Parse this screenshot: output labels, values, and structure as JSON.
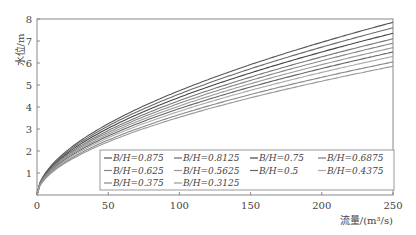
{
  "chart_data": {
    "type": "line",
    "title": "",
    "xlabel": "流量/(m³/s)",
    "ylabel": "水位/m",
    "xlim": [
      0,
      250
    ],
    "ylim": [
      0,
      8
    ],
    "xticks": [
      0,
      50,
      100,
      150,
      200,
      250
    ],
    "yticks": [
      1,
      2,
      3,
      4,
      5,
      6,
      7,
      8
    ],
    "grid": false,
    "legend_position": "lower right inside",
    "x": [
      0,
      25,
      50,
      75,
      100,
      125,
      150,
      175,
      200,
      225,
      250
    ],
    "series": [
      {
        "name": "B/H=0.875",
        "end": 7.85,
        "color": "#555555"
      },
      {
        "name": "B/H=0.8125",
        "end": 7.6,
        "color": "#6a6a6a"
      },
      {
        "name": "B/H=0.75",
        "end": 7.35,
        "color": "#444444"
      },
      {
        "name": "B/H=0.6875",
        "end": 7.1,
        "color": "#777777"
      },
      {
        "name": "B/H=0.625",
        "end": 6.9,
        "color": "#888888"
      },
      {
        "name": "B/H=0.5625",
        "end": 6.7,
        "color": "#999999"
      },
      {
        "name": "B/H=0.5",
        "end": 6.5,
        "color": "#666666"
      },
      {
        "name": "B/H=0.4375",
        "end": 6.3,
        "color": "#aaaaaa"
      },
      {
        "name": "B/H=0.375",
        "end": 6.05,
        "color": "#888888"
      },
      {
        "name": "B/H=0.3125",
        "end": 5.85,
        "color": "#999999"
      }
    ],
    "curve_model": "h = end * (Q/250)^0.55"
  }
}
